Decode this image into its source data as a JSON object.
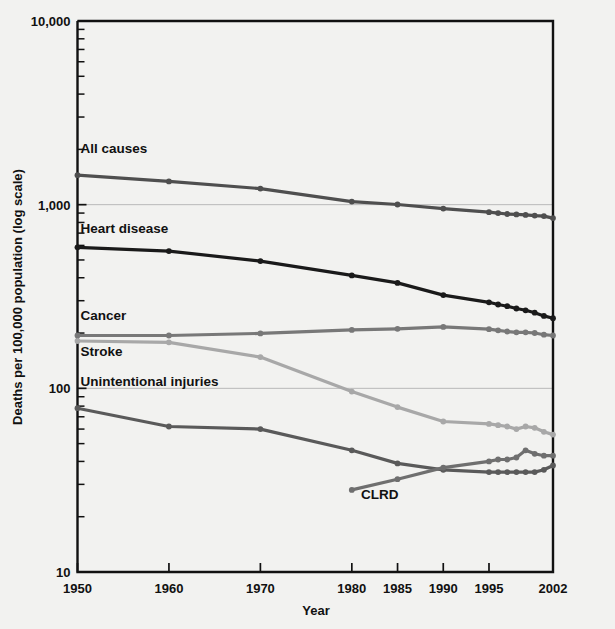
{
  "chart_data": {
    "type": "line",
    "title": "",
    "xlabel": "Year",
    "ylabel": "Deaths per 100,000 population (log scale)",
    "yscale": "log",
    "ylim": [
      10,
      10000
    ],
    "ytick_labels": [
      "10,000",
      "1,000",
      "100",
      "10"
    ],
    "ytick_values": [
      10000,
      1000,
      100,
      10
    ],
    "xtick_labels": [
      "1950",
      "1960",
      "1970",
      "1980",
      "1985",
      "1990",
      "1995",
      "2002"
    ],
    "xtick_values": [
      1950,
      1960,
      1970,
      1980,
      1985,
      1990,
      1995,
      2002
    ],
    "xlim": [
      1950,
      2002
    ],
    "grid": "horizontal-major",
    "legend": "inline-labels",
    "series": [
      {
        "name": "All causes",
        "color": "#4f4f4f",
        "label_x": 1950,
        "label_y": 1900,
        "x": [
          1950,
          1960,
          1970,
          1980,
          1985,
          1990,
          1995,
          1996,
          1997,
          1998,
          1999,
          2000,
          2001,
          2002
        ],
        "values": [
          1446,
          1339,
          1223,
          1039,
          1002,
          952,
          910,
          900,
          890,
          885,
          880,
          872,
          866,
          845
        ]
      },
      {
        "name": "Heart disease",
        "color": "#1a1a1a",
        "label_x": 1950,
        "label_y": 700,
        "x": [
          1950,
          1960,
          1970,
          1980,
          1985,
          1990,
          1995,
          1996,
          1997,
          1998,
          1999,
          2000,
          2001,
          2002
        ],
        "values": [
          586,
          559,
          493,
          412,
          375,
          322,
          294,
          286,
          280,
          272,
          266,
          258,
          248,
          241
        ]
      },
      {
        "name": "Cancer",
        "color": "#787878",
        "label_x": 1950,
        "label_y": 235,
        "x": [
          1950,
          1960,
          1970,
          1980,
          1985,
          1990,
          1995,
          1996,
          1997,
          1998,
          1999,
          2000,
          2001,
          2002
        ],
        "values": [
          194,
          194,
          199,
          208,
          211,
          216,
          210,
          207,
          204,
          202,
          202,
          200,
          196,
          194
        ]
      },
      {
        "name": "Stroke",
        "color": "#a8a8a8",
        "label_x": 1950,
        "label_y": 150,
        "x": [
          1950,
          1960,
          1970,
          1980,
          1985,
          1990,
          1995,
          1996,
          1997,
          1998,
          1999,
          2000,
          2001,
          2002
        ],
        "values": [
          181,
          178,
          148,
          96,
          79,
          66,
          64,
          63,
          62,
          60,
          62,
          61,
          58,
          56
        ]
      },
      {
        "name": "Unintentional injuries",
        "color": "#5a5a5a",
        "label_x": 1950,
        "label_y": 103,
        "x": [
          1950,
          1960,
          1970,
          1980,
          1985,
          1990,
          1995,
          1996,
          1997,
          1998,
          1999,
          2000,
          2001,
          2002
        ],
        "values": [
          78,
          62,
          60,
          46,
          39,
          36,
          35,
          35,
          35,
          35,
          35,
          35,
          36,
          38
        ]
      },
      {
        "name": "CLRD",
        "color": "#6f6f6f",
        "label_x": 1981,
        "label_y": 25,
        "x": [
          1980,
          1985,
          1990,
          1995,
          1996,
          1997,
          1998,
          1999,
          2000,
          2001,
          2002
        ],
        "values": [
          28,
          32,
          37,
          40,
          41,
          41,
          42,
          46,
          44,
          43,
          43
        ]
      }
    ]
  },
  "labels": {
    "y_axis_title": "Deaths per 100,000 population (log scale)",
    "x_axis_title": "Year"
  }
}
